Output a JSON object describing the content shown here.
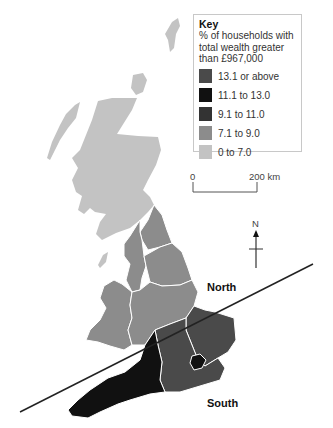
{
  "key": {
    "title": "Key",
    "description": "% of households with total wealth greater than £967,000",
    "items": [
      {
        "label": "13.1 or above",
        "color": "#4a4a4a"
      },
      {
        "label": "11.1 to 13.0",
        "color": "#111111"
      },
      {
        "label": "9.1 to 11.0",
        "color": "#333333"
      },
      {
        "label": "7.1 to 9.0",
        "color": "#8c8c8c"
      },
      {
        "label": "0 to 7.0",
        "color": "#c3c3c3"
      }
    ]
  },
  "scale_bar": {
    "start": "0",
    "end": "200 km"
  },
  "north_arrow": {
    "label": "N"
  },
  "divide_labels": {
    "north": "North",
    "south": "South"
  },
  "regions": {
    "scotland": {
      "band": "0 to 7.0",
      "color": "#c3c3c3"
    },
    "north_east": {
      "band": "7.1 to 9.0",
      "color": "#8c8c8c"
    },
    "north_west": {
      "band": "7.1 to 9.0",
      "color": "#8c8c8c"
    },
    "yorkshire": {
      "band": "7.1 to 9.0",
      "color": "#8c8c8c"
    },
    "wales": {
      "band": "7.1 to 9.0",
      "color": "#8c8c8c"
    },
    "midlands": {
      "band": "7.1 to 9.0",
      "color": "#8c8c8c"
    },
    "east_of_england": {
      "band": "13.1 or above",
      "color": "#4a4a4a"
    },
    "south_east": {
      "band": "13.1 or above",
      "color": "#4a4a4a"
    },
    "london": {
      "band": "11.1 to 13.0",
      "color": "#111111"
    },
    "south_west": {
      "band": "11.1 to 13.0",
      "color": "#111111"
    }
  }
}
